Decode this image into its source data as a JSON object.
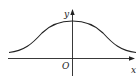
{
  "diagram": {
    "type": "function-graph",
    "axes": {
      "x_label": "x",
      "y_label": "y",
      "origin_label": "O"
    },
    "colors": {
      "stroke": "#222222",
      "background": "#ffffff"
    }
  }
}
